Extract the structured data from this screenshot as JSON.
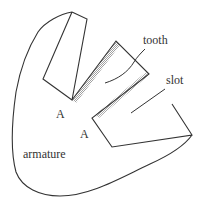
{
  "diagram": {
    "labels": {
      "tooth": "tooth",
      "slot": "slot",
      "armature": "armature",
      "corner_a1": "A",
      "corner_a2": "A"
    },
    "colors": {
      "stroke": "#333333",
      "hatch": "#999999",
      "text": "#333333"
    }
  }
}
